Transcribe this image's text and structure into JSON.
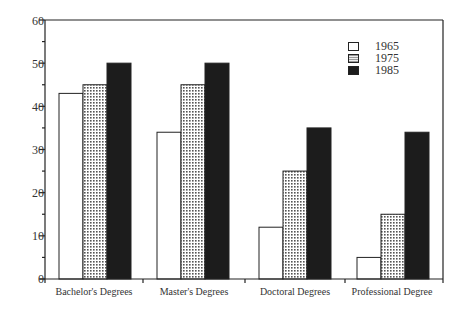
{
  "chart_data": {
    "type": "bar",
    "title": "",
    "xlabel": "",
    "ylabel": "",
    "ylim": [
      0,
      60
    ],
    "yticks": [
      0,
      10,
      20,
      30,
      40,
      50,
      60
    ],
    "grid": false,
    "legend_position": "upper right (inside)",
    "categories": [
      "Bachelor's Degrees",
      "Master's Degrees",
      "Doctoral Degrees",
      "Professional Degree"
    ],
    "series": [
      {
        "name": "1965",
        "pattern": "white",
        "values": [
          43,
          34,
          12,
          5
        ]
      },
      {
        "name": "1975",
        "pattern": "dotted",
        "values": [
          45,
          45,
          25,
          15
        ]
      },
      {
        "name": "1985",
        "pattern": "black",
        "values": [
          50,
          50,
          35,
          34
        ]
      }
    ]
  },
  "legend": [
    "1965",
    "1975",
    "1985"
  ],
  "yaxis": {
    "labels": [
      "0",
      "10",
      "20",
      "30",
      "40",
      "50",
      "60"
    ]
  },
  "xaxis": {
    "labels": [
      "Bachelor's Degrees",
      "Master's Degrees",
      "Doctoral Degrees",
      "Professional Degree"
    ]
  }
}
